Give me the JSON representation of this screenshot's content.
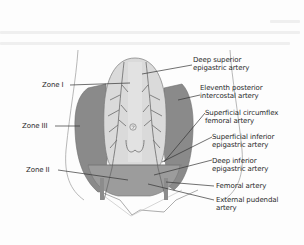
{
  "figure": {
    "zone_labels": [
      {
        "id": "zone-1",
        "text": "Zone I"
      },
      {
        "id": "zone-3",
        "text": "Zone III"
      },
      {
        "id": "zone-2",
        "text": "Zone II"
      }
    ],
    "artery_labels": [
      {
        "id": "deep-superior-epigastric",
        "line1": "Deep superior",
        "line2": "epigastric artery"
      },
      {
        "id": "eleventh-posterior-intercostal",
        "line1": "Eleventh posterior",
        "line2": "intercostal artery"
      },
      {
        "id": "superficial-circumflex-femoral",
        "line1": "Superficial circumflex",
        "line2": "femoral artery"
      },
      {
        "id": "superficial-inferior-epigastric",
        "line1": "Superficial inferior",
        "line2": "epigastric artery"
      },
      {
        "id": "deep-inferior-epigastric",
        "line1": "Deep inferior",
        "line2": "epigastric artery"
      },
      {
        "id": "femoral",
        "line1": "Femoral artery",
        "line2": ""
      },
      {
        "id": "external-pudendal",
        "line1": "External pudendal",
        "line2": "artery"
      }
    ],
    "umbilicus_glyph": "⊘",
    "colors": {
      "zone1_fill": "#d6d6d6",
      "zone2_fill": "#9c9c9c",
      "zone3_fill": "#8a8a8a",
      "artery_stroke": "#6a6a6a",
      "outline": "#7a7a7a",
      "leader_line": "#333333",
      "text": "#2a2a2a"
    }
  }
}
